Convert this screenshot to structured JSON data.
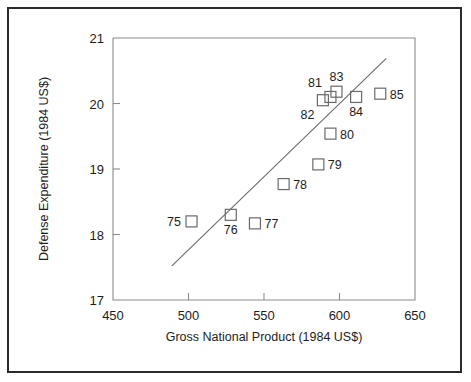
{
  "chart_data": {
    "type": "scatter",
    "title": "",
    "xlabel": "Gross National Product (1984 US$)",
    "ylabel": "Defense Expenditure (1984 US$)",
    "xlim": [
      450,
      650
    ],
    "ylim": [
      17,
      21
    ],
    "xticks": [
      450,
      500,
      550,
      600,
      650
    ],
    "yticks": [
      17,
      18,
      19,
      20,
      21
    ],
    "grid": false,
    "legend": "none",
    "marker_style": "open-square",
    "annotations_note": "Each point labeled with two-digit year",
    "points": [
      {
        "label": "75",
        "x": 502,
        "y": 18.2,
        "label_pos": "left"
      },
      {
        "label": "76",
        "x": 528,
        "y": 18.3,
        "label_pos": "below"
      },
      {
        "label": "77",
        "x": 544,
        "y": 18.17,
        "label_pos": "right"
      },
      {
        "label": "78",
        "x": 563,
        "y": 18.77,
        "label_pos": "right"
      },
      {
        "label": "79",
        "x": 586,
        "y": 19.07,
        "label_pos": "right"
      },
      {
        "label": "80",
        "x": 594,
        "y": 19.54,
        "label_pos": "right"
      },
      {
        "label": "81",
        "x": 594,
        "y": 20.1,
        "label_pos": "above-left"
      },
      {
        "label": "82",
        "x": 589,
        "y": 20.05,
        "label_pos": "below-left"
      },
      {
        "label": "83",
        "x": 598,
        "y": 20.18,
        "label_pos": "above"
      },
      {
        "label": "84",
        "x": 611,
        "y": 20.1,
        "label_pos": "below"
      },
      {
        "label": "85",
        "x": 627,
        "y": 20.15,
        "label_pos": "right"
      }
    ],
    "trendline": {
      "x0": 489,
      "y0": 17.52,
      "x1": 631,
      "y1": 20.69
    }
  },
  "axes": {
    "x_tick_labels": [
      "450",
      "500",
      "550",
      "600",
      "650"
    ],
    "y_tick_labels": [
      "17",
      "18",
      "19",
      "20",
      "21"
    ],
    "x_title": "Gross National Product (1984 US$)",
    "y_title": "Defense Expenditure (1984 US$)"
  },
  "colors": {
    "frame": "#2b2b2b",
    "axis": "#8b8b8b",
    "marker": "#6a6a6a",
    "text": "#1d1d1d",
    "background": "#ffffff"
  }
}
